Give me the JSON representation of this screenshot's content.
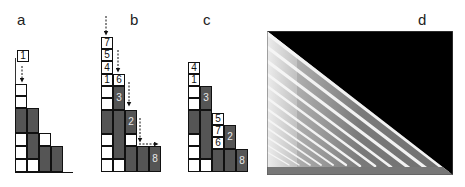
{
  "panels": {
    "a": {
      "label": "a",
      "incoming_block": "1"
    },
    "b": {
      "label": "b",
      "blocks": [
        "7",
        "5",
        "4",
        "1",
        "6",
        "3",
        "2",
        "8"
      ]
    },
    "c": {
      "label": "c",
      "blocks": [
        "4",
        "1",
        "3",
        "5",
        "7",
        "6",
        "2",
        "8"
      ]
    },
    "d": {
      "label": "d",
      "description": "grayscale density plot: black upper-right triangle, gray lower-left region with white diagonal stripes"
    }
  },
  "colors": {
    "filled": "#555555",
    "empty": "#ffffff",
    "border": "#111111",
    "background_d": "#000000",
    "region_d": "#7a7a7a"
  }
}
